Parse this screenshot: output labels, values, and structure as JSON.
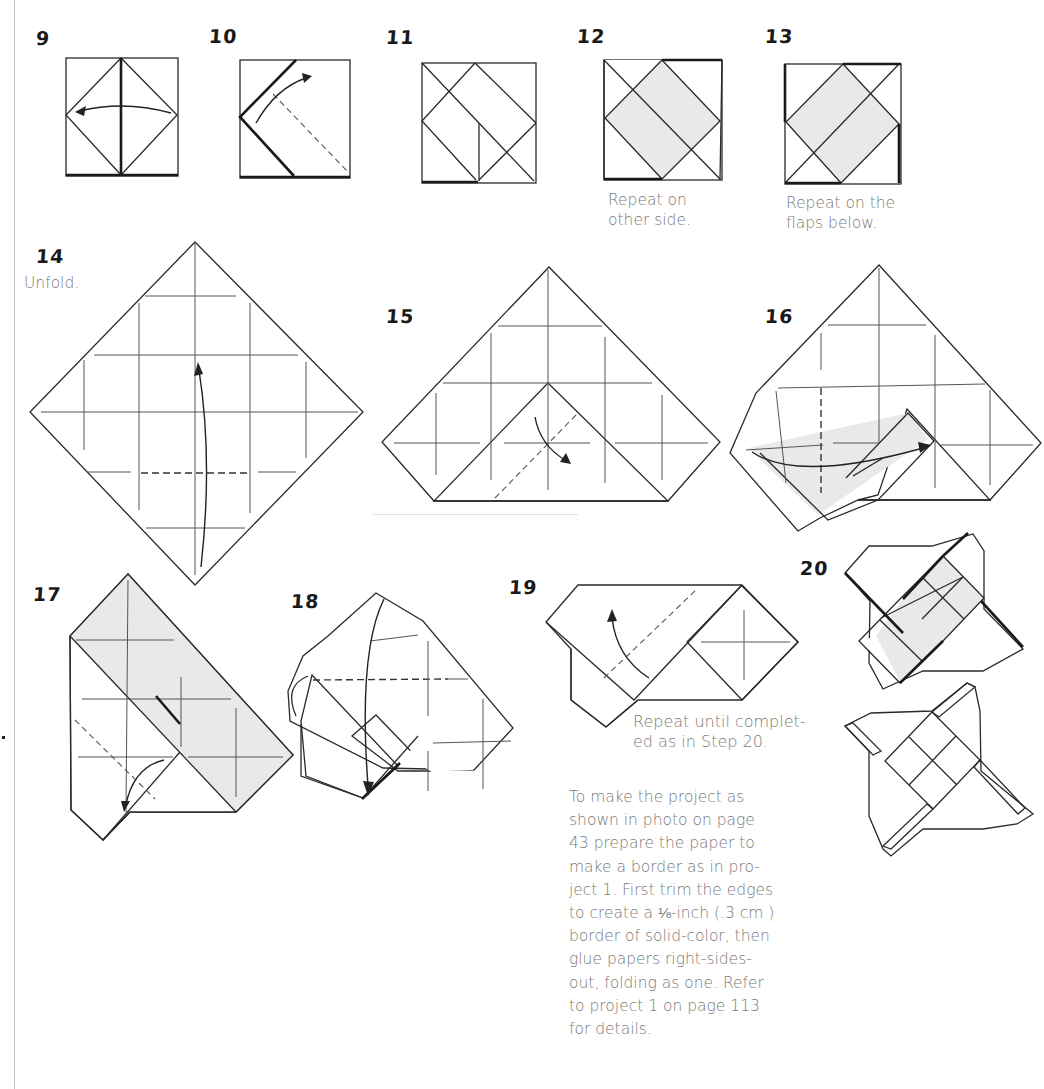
{
  "page": {
    "type": "origami-instructions",
    "steps": [
      {
        "number": "9",
        "caption": null,
        "action": "fold-arrow-left"
      },
      {
        "number": "10",
        "caption": null,
        "action": "valley-fold-dashed"
      },
      {
        "number": "11",
        "caption": null,
        "action": "result"
      },
      {
        "number": "12",
        "caption_lines": [
          "Repeat on",
          "other side."
        ]
      },
      {
        "number": "13",
        "caption_lines": [
          "Repeat on the",
          "flaps below."
        ]
      },
      {
        "number": "14",
        "caption_lines": [
          "Unfold."
        ]
      },
      {
        "number": "15",
        "caption": null,
        "action": "fold-corner"
      },
      {
        "number": "16",
        "caption": null,
        "action": "fold-flap-over"
      },
      {
        "number": "17",
        "caption": null,
        "action": "fold-flap-down"
      },
      {
        "number": "18",
        "caption": null,
        "action": "fold-down"
      },
      {
        "number": "19",
        "caption_lines": [
          "Repeat until complet-",
          "ed as in Step 20."
        ]
      },
      {
        "number": "20",
        "caption": null,
        "action": "finished-views"
      }
    ],
    "note_lines": [
      "To make the project as",
      "shown in photo on page",
      "43 prepare the paper to",
      "make a border as in pro-",
      "ject 1. First trim the edges",
      "to create a ⅛-inch (.3 cm )",
      "border of solid-color, then",
      "glue papers right-sides-",
      "out, folding as one. Refer",
      "to project 1 on page 113",
      "for details."
    ],
    "colors": {
      "paper_colored": "#e9e9e9",
      "paper_white": "#ffffff",
      "line": "#2a2a2a",
      "caption_text": "#7a7a7a",
      "step_number": "#1a1a1a"
    }
  }
}
